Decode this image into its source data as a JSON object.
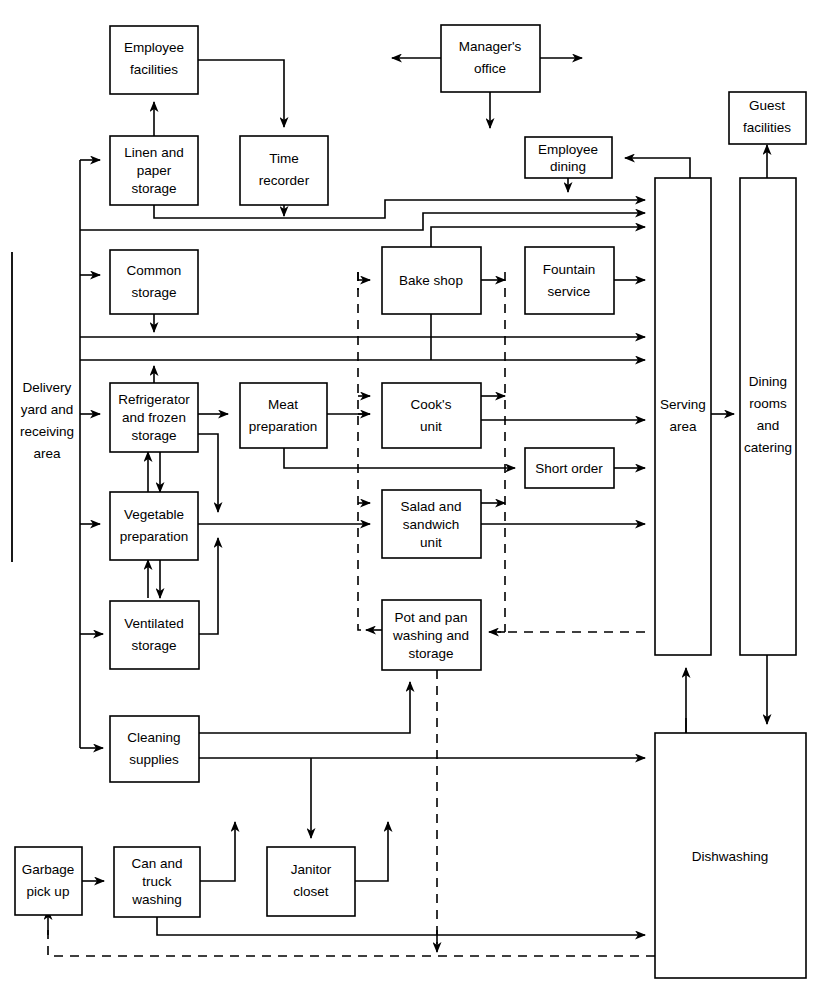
{
  "diagram": {
    "type": "flowchart",
    "stroke_color": "#000000",
    "background_color": "#ffffff",
    "legend": {
      "solid_line": "material / personnel flow",
      "dashed_line": "return flow"
    }
  },
  "nodes": {
    "employee_facilities": {
      "label": "Employee facilities",
      "lines": [
        "Employee",
        "facilities"
      ]
    },
    "managers_office": {
      "label": "Manager's office",
      "lines": [
        "Manager's",
        "office"
      ]
    },
    "guest_facilities": {
      "label": "Guest facilities",
      "lines": [
        "Guest",
        "facilities"
      ]
    },
    "linen_paper_storage": {
      "label": "Linen and paper storage",
      "lines": [
        "Linen and",
        "paper",
        "storage"
      ]
    },
    "time_recorder": {
      "label": "Time recorder",
      "lines": [
        "Time",
        "recorder"
      ]
    },
    "employee_dining": {
      "label": "Employee dining",
      "lines": [
        "Employee",
        "dining"
      ]
    },
    "common_storage": {
      "label": "Common storage",
      "lines": [
        "Common",
        "storage"
      ]
    },
    "bake_shop": {
      "label": "Bake shop",
      "lines": [
        "Bake shop"
      ]
    },
    "fountain_service": {
      "label": "Fountain service",
      "lines": [
        "Fountain",
        "service"
      ]
    },
    "refrigerator_frozen_storage": {
      "label": "Refrigerator and frozen storage",
      "lines": [
        "Refrigerator",
        "and frozen",
        "storage"
      ]
    },
    "meat_preparation": {
      "label": "Meat preparation",
      "lines": [
        "Meat",
        "preparation"
      ]
    },
    "cooks_unit": {
      "label": "Cook's unit",
      "lines": [
        "Cook's",
        "unit"
      ]
    },
    "short_order": {
      "label": "Short order",
      "lines": [
        "Short order"
      ]
    },
    "vegetable_preparation": {
      "label": "Vegetable preparation",
      "lines": [
        "Vegetable",
        "preparation"
      ]
    },
    "salad_sandwich_unit": {
      "label": "Salad and sandwich unit",
      "lines": [
        "Salad and",
        "sandwich",
        "unit"
      ]
    },
    "ventilated_storage": {
      "label": "Ventilated storage",
      "lines": [
        "Ventilated",
        "storage"
      ]
    },
    "pot_pan_washing": {
      "label": "Pot and pan washing and storage",
      "lines": [
        "Pot and pan",
        "washing and",
        "storage"
      ]
    },
    "cleaning_supplies": {
      "label": "Cleaning supplies",
      "lines": [
        "Cleaning",
        "supplies"
      ]
    },
    "garbage_pick_up": {
      "label": "Garbage pick up",
      "lines": [
        "Garbage",
        "pick up"
      ]
    },
    "can_truck_washing": {
      "label": "Can and truck washing",
      "lines": [
        "Can and",
        "truck",
        "washing"
      ]
    },
    "janitor_closet": {
      "label": "Janitor closet",
      "lines": [
        "Janitor",
        "closet"
      ]
    },
    "serving_area": {
      "label": "Serving area",
      "lines": [
        "Serving",
        "area"
      ]
    },
    "dining_rooms_catering": {
      "label": "Dining rooms and catering",
      "lines": [
        "Dining",
        "rooms",
        "and",
        "catering"
      ]
    },
    "dishwashing": {
      "label": "Dishwashing",
      "lines": [
        "Dishwashing"
      ]
    },
    "delivery_yard": {
      "label": "Delivery yard and receiving area",
      "lines": [
        "Delivery",
        "yard and",
        "receiving",
        "area"
      ]
    }
  }
}
